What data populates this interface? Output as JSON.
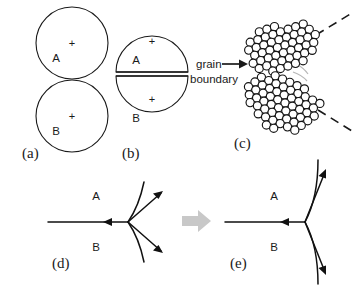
{
  "figure": {
    "panels": [
      {
        "id": "a",
        "label": "(a)",
        "caption": "two separate growing grains before impingement",
        "grains": [
          "A",
          "B"
        ],
        "center_marks": [
          "+",
          "+"
        ]
      },
      {
        "id": "b",
        "label": "(b)",
        "caption": "grains impinged, forming a flat grain boundary",
        "grains": [
          "A",
          "B"
        ],
        "center_marks": [
          "+",
          "+"
        ],
        "annotation": "grain boundary"
      },
      {
        "id": "c",
        "label": "(c)",
        "caption": "atomic scale view of the grain boundary region"
      },
      {
        "id": "d",
        "label": "(d)",
        "caption": "triple junction with curved boundaries",
        "grains": [
          "A",
          "B"
        ]
      },
      {
        "id": "e",
        "label": "(e)",
        "caption": "triple junction after equilibration, straighter boundaries",
        "grains": [
          "A",
          "B"
        ]
      }
    ],
    "annotations": {
      "grain_boundary_line1": "grain",
      "grain_boundary_line2": "boundary"
    },
    "transition": {
      "arrow": "rightward-gray-arrow",
      "from": "(d)",
      "to": "(e)"
    },
    "colors": {
      "ink": "#1a1a1a",
      "background": "#ffffff",
      "transition_arrow": "#c8c8c8",
      "atom_fill": "#ffffff",
      "atom_stroke": "#141414"
    }
  }
}
